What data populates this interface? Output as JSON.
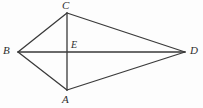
{
  "figure": {
    "type": "geometry-diagram",
    "shape": "kite-quadrilateral-with-diagonals",
    "canvas": {
      "width": 203,
      "height": 108,
      "background": "#fdfdfd"
    },
    "stroke": {
      "color": "#3a3a3a",
      "width": 1.3
    },
    "labels": {
      "A": "A",
      "B": "B",
      "C": "C",
      "D": "D",
      "E": "E"
    },
    "points": {
      "A": {
        "x": 67,
        "y": 90
      },
      "B": {
        "x": 18,
        "y": 52
      },
      "C": {
        "x": 67,
        "y": 13
      },
      "D": {
        "x": 185,
        "y": 52
      },
      "E": {
        "x": 67,
        "y": 52
      }
    },
    "segments": [
      {
        "name": "BC",
        "from": "B",
        "to": "C"
      },
      {
        "name": "CD",
        "from": "C",
        "to": "D"
      },
      {
        "name": "DA",
        "from": "D",
        "to": "A"
      },
      {
        "name": "AB",
        "from": "A",
        "to": "B"
      },
      {
        "name": "BD",
        "from": "B",
        "to": "D"
      },
      {
        "name": "CA",
        "from": "C",
        "to": "A"
      }
    ]
  }
}
